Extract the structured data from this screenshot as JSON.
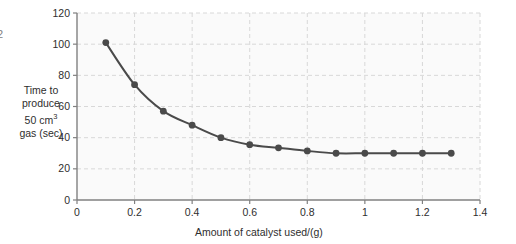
{
  "chart_data": {
    "type": "line",
    "title": "",
    "xlabel": "Amount of catalyst used/(g)",
    "ylabel": "Time to produce 50 cm3 gas (sec)",
    "ylabel_lines": [
      "Time to",
      "produce",
      "50 cm",
      "gas (sec)"
    ],
    "ylabel_superscript": "3",
    "x": [
      0.1,
      0.2,
      0.3,
      0.4,
      0.5,
      0.6,
      0.7,
      0.8,
      0.9,
      1.0,
      1.1,
      1.2,
      1.3
    ],
    "values": [
      101,
      74,
      57,
      48,
      40,
      35.5,
      33.5,
      31.5,
      30,
      30,
      30,
      30,
      30
    ],
    "xlim": [
      0,
      1.4
    ],
    "ylim": [
      0,
      120
    ],
    "xticks": [
      0,
      0.2,
      0.4,
      0.6,
      0.8,
      1.0,
      1.2,
      1.4
    ],
    "xtick_labels": [
      "0",
      "0.2",
      "0.4",
      "0.6",
      "0.8",
      "1",
      "1.2",
      "1.4"
    ],
    "yticks": [
      0,
      20,
      40,
      60,
      80,
      100,
      120
    ],
    "ytick_labels": [
      "0",
      "20",
      "40",
      "60",
      "80",
      "100",
      "120"
    ],
    "grid": true,
    "grid_style": "dashed",
    "legend": "none",
    "series_color": "#4a4a4a",
    "grid_color": "#d8d8d8",
    "axis_color": "#808080",
    "plot_bg": "#fafafa",
    "marker": "circle"
  },
  "edge_artifact": {
    "text": "2"
  }
}
